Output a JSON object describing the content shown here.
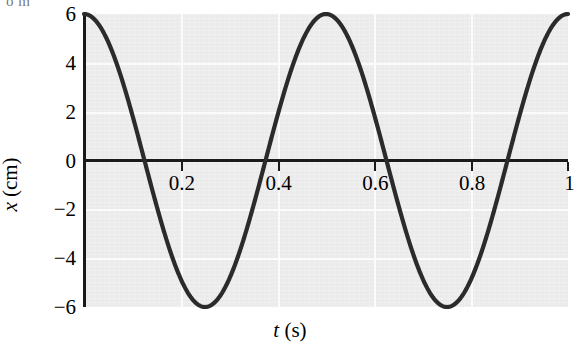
{
  "figure": {
    "cropped_text_fragment": "o m",
    "background_color": "#ffffff",
    "plot_background_color": "#ebebeb",
    "gridline_color": "#fbfbfb",
    "axis_color": "#1a1a1a",
    "curve_color": "#2b2b2b"
  },
  "chart_data": {
    "type": "line",
    "title": "",
    "xlabel": "t (s)",
    "ylabel": "x (cm)",
    "xlabel_symbol": "t",
    "xlabel_unit": "(s)",
    "ylabel_symbol": "x",
    "ylabel_unit": "(cm)",
    "xlim": [
      0,
      1
    ],
    "ylim": [
      -6,
      6
    ],
    "grid": true,
    "legend": "none",
    "amplitude": 6,
    "period": 0.5,
    "frequency": 2,
    "equation": "x = 6 cos(4 pi t)",
    "x_ticks": [
      0.2,
      0.4,
      0.6,
      0.8,
      1
    ],
    "x_tick_labels": [
      "0.2",
      "0.4",
      "0.6",
      "0.8",
      "1"
    ],
    "y_ticks": [
      6,
      4,
      2,
      0,
      -2,
      -4,
      -6
    ],
    "y_tick_labels": [
      "6",
      "4",
      "2",
      "0",
      "−2",
      "−4",
      "−6"
    ],
    "series": [
      {
        "name": "x(t)",
        "x": [
          0,
          0.025,
          0.05,
          0.075,
          0.1,
          0.125,
          0.15,
          0.175,
          0.2,
          0.225,
          0.25,
          0.275,
          0.3,
          0.325,
          0.35,
          0.375,
          0.4,
          0.425,
          0.45,
          0.475,
          0.5,
          0.525,
          0.55,
          0.575,
          0.6,
          0.625,
          0.65,
          0.675,
          0.7,
          0.725,
          0.75,
          0.775,
          0.8,
          0.825,
          0.85,
          0.875,
          0.9,
          0.925,
          0.95,
          0.975,
          1
        ],
        "values": [
          6,
          5.54,
          4.24,
          2.3,
          0,
          -2.3,
          -4.24,
          -5.54,
          -6,
          -5.54,
          -4.24,
          -2.3,
          0,
          2.3,
          4.24,
          5.54,
          6,
          5.54,
          4.24,
          2.3,
          0,
          -2.3,
          -4.24,
          -5.54,
          -6,
          -5.54,
          -4.24,
          -2.3,
          0,
          2.3,
          4.24,
          5.54,
          6,
          5.54,
          4.24,
          2.3,
          0,
          -2.3,
          -4.24,
          -5.54,
          -6
        ]
      }
    ],
    "zero_crossings": [
      0.125,
      0.375,
      0.625,
      0.875
    ],
    "maxima_t": [
      0,
      0.5,
      1
    ],
    "minima_t": [
      0.25,
      0.75
    ]
  }
}
